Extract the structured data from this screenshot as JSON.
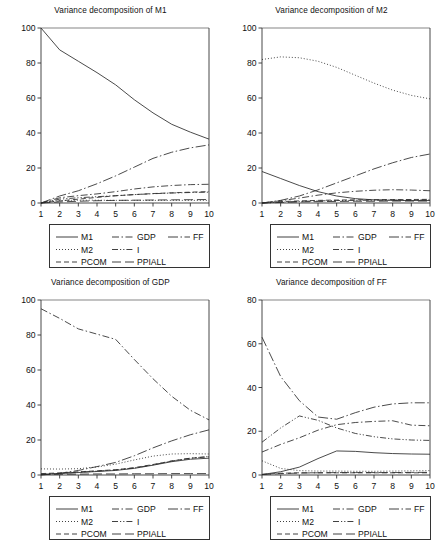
{
  "figure": {
    "width": 442,
    "height": 543,
    "background": "#ffffff",
    "layout": "2x2 grid of line charts, each with a boxed legend beneath the axes"
  },
  "series_styles": {
    "M1": {
      "label": "M1",
      "dash": "solid",
      "color": "#2b2b2b"
    },
    "M2": {
      "label": "M2",
      "dash": "dotted",
      "color": "#2b2b2b"
    },
    "PCOM": {
      "label": "PCOM",
      "dash": "dashed",
      "color": "#2b2b2b"
    },
    "GDP": {
      "label": "GDP",
      "dash": "dashdot",
      "color": "#2b2b2b"
    },
    "I": {
      "label": "I",
      "dash": "dashdotdot",
      "color": "#2b2b2b"
    },
    "PPIALL": {
      "label": "PPIALL",
      "dash": "longdash",
      "color": "#2b2b2b"
    },
    "FF": {
      "label": "FF",
      "dash": "dashdotlong",
      "color": "#2b2b2b"
    }
  },
  "legend": {
    "rows": [
      [
        {
          "key": "M1",
          "label": "M1"
        },
        {
          "key": "GDP",
          "label": "GDP"
        },
        {
          "key": "FF",
          "label": "FF"
        }
      ],
      [
        {
          "key": "M2",
          "label": "M2"
        },
        {
          "key": "I",
          "label": "I"
        }
      ],
      [
        {
          "key": "PCOM",
          "label": "PCOM"
        },
        {
          "key": "PPIALL",
          "label": "PPIALL"
        }
      ]
    ]
  },
  "chart_data": [
    {
      "id": "m1",
      "type": "line",
      "title": "Variance decomposition of M1",
      "xlabel": "",
      "ylabel": "",
      "x": [
        1,
        2,
        3,
        4,
        5,
        6,
        7,
        8,
        9,
        10
      ],
      "xtick_labels": [
        "1",
        "2",
        "3",
        "4",
        "5",
        "6",
        "7",
        "8",
        "9",
        "10"
      ],
      "xlim": [
        1,
        10
      ],
      "ylim": [
        0,
        100
      ],
      "yticks": [
        0,
        20,
        40,
        60,
        80,
        100
      ],
      "ytick_labels": [
        "0",
        "20",
        "40",
        "60",
        "80",
        "100"
      ],
      "grid": false,
      "legend_position": "below-axes",
      "series": [
        {
          "name": "M1",
          "values": [
            100.0,
            87.5,
            81.0,
            74.5,
            67.5,
            59.0,
            51.5,
            45.0,
            40.5,
            36.5
          ]
        },
        {
          "name": "M2",
          "values": [
            0.0,
            1.4,
            1.6,
            1.6,
            1.5,
            1.5,
            1.5,
            1.5,
            1.5,
            1.5
          ]
        },
        {
          "name": "PCOM",
          "values": [
            0.0,
            1.2,
            2.2,
            3.2,
            4.1,
            4.8,
            5.4,
            5.8,
            6.2,
            6.5
          ]
        },
        {
          "name": "GDP",
          "values": [
            0.0,
            3.0,
            4.2,
            5.2,
            6.5,
            8.0,
            9.2,
            10.0,
            10.5,
            10.7
          ]
        },
        {
          "name": "I",
          "values": [
            0.0,
            2.2,
            3.0,
            3.6,
            4.2,
            4.8,
            5.3,
            5.7,
            6.0,
            6.2
          ]
        },
        {
          "name": "PPIALL",
          "values": [
            0.0,
            0.6,
            1.0,
            1.3,
            1.5,
            1.6,
            1.7,
            1.8,
            1.9,
            2.0
          ]
        },
        {
          "name": "FF",
          "values": [
            0.0,
            4.0,
            7.0,
            11.0,
            15.5,
            20.5,
            25.5,
            29.0,
            31.5,
            33.2
          ]
        }
      ]
    },
    {
      "id": "m2",
      "type": "line",
      "title": "Variance decomposition of M2",
      "xlabel": "",
      "ylabel": "",
      "x": [
        1,
        2,
        3,
        4,
        5,
        6,
        7,
        8,
        9,
        10
      ],
      "xtick_labels": [
        "1",
        "2",
        "3",
        "4",
        "5",
        "6",
        "7",
        "8",
        "9",
        "10"
      ],
      "xlim": [
        1,
        10
      ],
      "ylim": [
        0,
        100
      ],
      "yticks": [
        0,
        20,
        40,
        60,
        80,
        100
      ],
      "ytick_labels": [
        "0",
        "20",
        "40",
        "60",
        "80",
        "100"
      ],
      "grid": false,
      "legend_position": "below-axes",
      "series": [
        {
          "name": "M1",
          "values": [
            18.0,
            14.0,
            10.0,
            6.5,
            4.0,
            2.5,
            1.8,
            1.5,
            1.4,
            1.4
          ]
        },
        {
          "name": "M2",
          "values": [
            82.0,
            83.5,
            83.0,
            81.0,
            77.5,
            73.0,
            68.5,
            64.5,
            61.5,
            59.5
          ]
        },
        {
          "name": "PCOM",
          "values": [
            0.0,
            0.8,
            1.2,
            1.5,
            1.7,
            1.8,
            1.9,
            2.0,
            2.0,
            2.1
          ]
        },
        {
          "name": "GDP",
          "values": [
            0.0,
            1.3,
            2.8,
            4.5,
            5.8,
            6.7,
            7.3,
            7.6,
            7.4,
            7.0
          ]
        },
        {
          "name": "I",
          "values": [
            0.0,
            0.5,
            0.9,
            1.2,
            1.4,
            1.5,
            1.6,
            1.7,
            1.7,
            1.8
          ]
        },
        {
          "name": "PPIALL",
          "values": [
            0.0,
            0.3,
            0.6,
            0.8,
            0.9,
            1.0,
            1.0,
            1.1,
            1.1,
            1.1
          ]
        },
        {
          "name": "FF",
          "values": [
            0.0,
            1.5,
            4.0,
            7.5,
            11.5,
            15.5,
            19.5,
            23.0,
            26.0,
            28.0
          ]
        }
      ]
    },
    {
      "id": "gdp",
      "type": "line",
      "title": "Variance decomposition of GDP",
      "xlabel": "",
      "ylabel": "",
      "x": [
        1,
        2,
        3,
        4,
        5,
        6,
        7,
        8,
        9,
        10
      ],
      "xtick_labels": [
        "1",
        "2",
        "3",
        "4",
        "5",
        "6",
        "7",
        "8",
        "9",
        "10"
      ],
      "xlim": [
        1,
        10
      ],
      "ylim": [
        0,
        100
      ],
      "yticks": [
        0,
        20,
        40,
        60,
        80,
        100
      ],
      "ytick_labels": [
        "0",
        "20",
        "40",
        "60",
        "80",
        "100"
      ],
      "grid": false,
      "legend_position": "below-axes",
      "series": [
        {
          "name": "M1",
          "values": [
            0.4,
            0.8,
            1.4,
            2.0,
            2.6,
            3.8,
            5.6,
            7.6,
            9.0,
            9.6
          ]
        },
        {
          "name": "M2",
          "values": [
            3.5,
            3.4,
            3.6,
            4.6,
            6.2,
            8.6,
            10.8,
            12.0,
            12.2,
            12.0
          ]
        },
        {
          "name": "PCOM",
          "values": [
            0.8,
            1.2,
            1.8,
            2.4,
            3.0,
            4.2,
            6.0,
            8.0,
            9.6,
            10.4
          ]
        },
        {
          "name": "GDP",
          "values": [
            95.0,
            89.5,
            83.5,
            80.5,
            77.5,
            66.0,
            55.0,
            45.0,
            37.0,
            31.5
          ]
        },
        {
          "name": "I",
          "values": [
            0.3,
            0.9,
            1.6,
            2.2,
            2.9,
            4.0,
            5.8,
            8.0,
            9.6,
            10.6
          ]
        },
        {
          "name": "PPIALL",
          "values": [
            0.2,
            0.4,
            0.5,
            0.6,
            0.6,
            0.7,
            0.7,
            0.8,
            0.8,
            0.8
          ]
        },
        {
          "name": "FF",
          "values": [
            0.0,
            1.0,
            2.6,
            4.8,
            7.2,
            11.0,
            15.5,
            19.5,
            23.0,
            25.8
          ]
        }
      ]
    },
    {
      "id": "ff",
      "type": "line",
      "title": "Variance decomposition of FF",
      "xlabel": "",
      "ylabel": "",
      "x": [
        1,
        2,
        3,
        4,
        5,
        6,
        7,
        8,
        9,
        10
      ],
      "xtick_labels": [
        "1",
        "2",
        "3",
        "4",
        "5",
        "6",
        "7",
        "8",
        "9",
        "10"
      ],
      "xlim": [
        1,
        10
      ],
      "ylim": [
        0,
        80
      ],
      "yticks": [
        0,
        20,
        40,
        60,
        80
      ],
      "ytick_labels": [
        "0",
        "20",
        "40",
        "60",
        "80"
      ],
      "grid": false,
      "legend_position": "below-axes",
      "series": [
        {
          "name": "M1",
          "values": [
            0.2,
            1.5,
            3.6,
            7.5,
            11.0,
            10.8,
            10.2,
            9.8,
            9.6,
            9.5
          ]
        },
        {
          "name": "M2",
          "values": [
            6.5,
            3.0,
            2.0,
            1.8,
            1.8,
            1.7,
            1.7,
            1.8,
            1.9,
            2.0
          ]
        },
        {
          "name": "PCOM",
          "values": [
            0.3,
            0.8,
            1.0,
            1.0,
            1.0,
            1.0,
            1.0,
            1.0,
            1.0,
            1.0
          ]
        },
        {
          "name": "GDP",
          "values": [
            10.5,
            14.0,
            17.0,
            20.5,
            23.0,
            24.0,
            24.5,
            24.8,
            22.8,
            22.5
          ]
        },
        {
          "name": "I",
          "values": [
            15.0,
            21.5,
            27.0,
            25.0,
            21.5,
            19.0,
            17.5,
            16.5,
            16.0,
            15.8
          ]
        },
        {
          "name": "PPIALL",
          "values": [
            0.2,
            0.6,
            0.9,
            1.0,
            1.1,
            1.1,
            1.1,
            1.1,
            1.2,
            1.2
          ]
        },
        {
          "name": "FF",
          "values": [
            63.0,
            45.0,
            34.0,
            26.5,
            25.5,
            28.5,
            31.0,
            32.5,
            33.0,
            33.0
          ]
        }
      ]
    }
  ]
}
